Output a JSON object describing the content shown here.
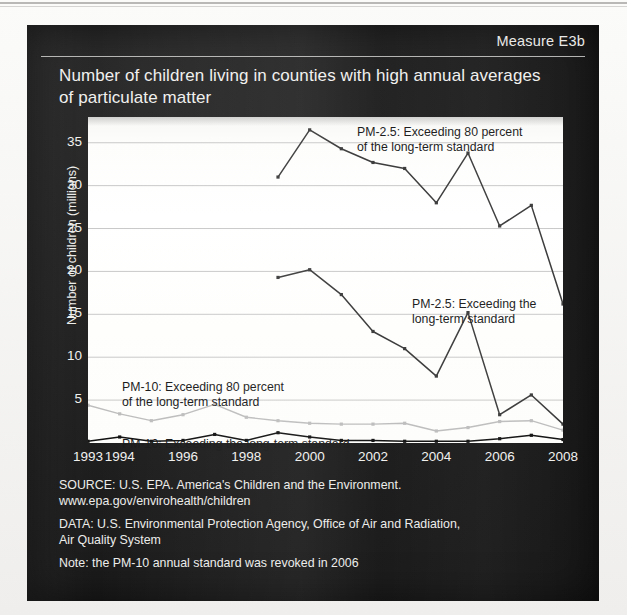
{
  "panel": {
    "measure_label": "Measure E3b",
    "title": "Number of children living in counties with high annual averages of particulate matter"
  },
  "footer": {
    "source": "SOURCE: U.S. EPA. America's Children and the Environment.\nwww.epa.gov/envirohealth/children",
    "data": "DATA: U.S. Environmental Protection Agency, Office of Air and Radiation,\nAir Quality System",
    "note": "Note: the PM-10 annual standard was revoked in 2006"
  },
  "annotations": {
    "pm25_80": "PM-2.5: Exceeding 80 percent\nof the long-term standard",
    "pm25_std": "PM-2.5: Exceeding the\nlong-term standard",
    "pm10_80": "PM-10: Exceeding 80 percent\nof the long-term standard",
    "pm10_std": "PM-10: Exceeding the long-term standard"
  },
  "colors": {
    "panel_background": "#1d1d1d",
    "plot_background": "#ffffff",
    "text_light": "#f0f0ee",
    "text_dark": "#1a1a1a",
    "gridline": "#c9c9c9",
    "series_dark": "#3a3a3a",
    "series_black": "#111111",
    "series_light_gray": "#bdbdbd"
  },
  "chart_data": {
    "type": "line",
    "title": "Number of children living in counties with high annual averages of particulate matter",
    "xlabel": "",
    "ylabel": "Number of children (millions)",
    "x": [
      1993,
      1994,
      1995,
      1996,
      1997,
      1998,
      1999,
      2000,
      2001,
      2002,
      2003,
      2004,
      2005,
      2006,
      2007,
      2008
    ],
    "xlim": [
      1993,
      2008
    ],
    "ylim": [
      0,
      38
    ],
    "yticks": [
      5,
      10,
      15,
      20,
      25,
      30,
      35
    ],
    "xticks": [
      1993,
      1994,
      1996,
      1998,
      2000,
      2002,
      2004,
      2006,
      2008
    ],
    "xtick_labels": [
      "1993",
      "1994",
      "1996",
      "1998",
      "2000",
      "2002",
      "2004",
      "2006",
      "2008"
    ],
    "grid": true,
    "legend": "annotations-inline",
    "series": [
      {
        "name": "PM-2.5: Exceeding 80 percent of the long-term standard",
        "color": "#3a3a3a",
        "x": [
          1999,
          2000,
          2001,
          2002,
          2003,
          2004,
          2005,
          2006,
          2007,
          2008
        ],
        "values": [
          31.0,
          36.5,
          34.3,
          32.7,
          32.0,
          28.0,
          33.8,
          25.3,
          27.7,
          16.2
        ]
      },
      {
        "name": "PM-2.5: Exceeding the long-term standard",
        "color": "#3a3a3a",
        "x": [
          1999,
          2000,
          2001,
          2002,
          2003,
          2004,
          2005,
          2006,
          2007,
          2008
        ],
        "values": [
          19.3,
          20.2,
          17.3,
          13.0,
          11.0,
          7.8,
          15.2,
          3.3,
          5.6,
          2.2
        ]
      },
      {
        "name": "PM-10: Exceeding 80 percent of the long-term standard",
        "color": "#bdbdbd",
        "x": [
          1993,
          1994,
          1995,
          1996,
          1997,
          1998,
          1999,
          2000,
          2001,
          2002,
          2003,
          2004,
          2005,
          2006,
          2007,
          2008
        ],
        "values": [
          4.4,
          3.4,
          2.6,
          3.3,
          4.5,
          3.0,
          2.6,
          2.3,
          2.2,
          2.2,
          2.3,
          1.4,
          1.8,
          2.5,
          2.6,
          1.5
        ]
      },
      {
        "name": "PM-10: Exceeding the long-term standard",
        "color": "#111111",
        "x": [
          1993,
          1994,
          1995,
          1996,
          1997,
          1998,
          1999,
          2000,
          2001,
          2002,
          2003,
          2004,
          2005,
          2006,
          2007,
          2008
        ],
        "values": [
          0.2,
          0.7,
          0.2,
          0.3,
          1.0,
          0.3,
          1.2,
          0.7,
          0.3,
          0.3,
          0.2,
          0.2,
          0.2,
          0.5,
          0.9,
          0.4
        ]
      }
    ]
  }
}
